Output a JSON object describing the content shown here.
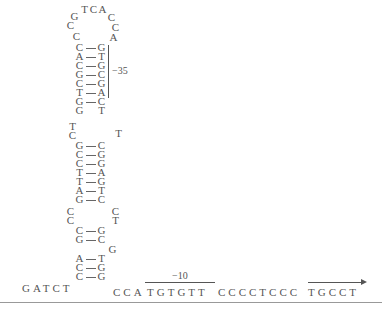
{
  "loop_top": [
    {
      "b": "T",
      "x": 80,
      "y": 4
    },
    {
      "b": "C",
      "x": 89,
      "y": 4
    },
    {
      "b": "A",
      "x": 98,
      "y": 4
    },
    {
      "b": "G",
      "x": 70,
      "y": 11
    },
    {
      "b": "C",
      "x": 107,
      "y": 12
    },
    {
      "b": "C",
      "x": 66,
      "y": 20
    },
    {
      "b": "C",
      "x": 111,
      "y": 22
    },
    {
      "b": "C",
      "x": 72,
      "y": 31
    },
    {
      "b": "A",
      "x": 109,
      "y": 32
    }
  ],
  "stem1": [
    {
      "l": "C",
      "r": "G",
      "y": 42
    },
    {
      "l": "A",
      "r": "T",
      "y": 51
    },
    {
      "l": "C",
      "r": "G",
      "y": 60
    },
    {
      "l": "G",
      "r": "C",
      "y": 69
    },
    {
      "l": "C",
      "r": "G",
      "y": 78
    },
    {
      "l": "T",
      "r": "A",
      "y": 87
    },
    {
      "l": "G",
      "r": "C",
      "y": 96
    }
  ],
  "stem1_unpaired": {
    "l": "G",
    "r": "T",
    "y": 105
  },
  "label_35": "−35",
  "bulge_mid": [
    {
      "b": "T",
      "x": 68,
      "y": 121
    },
    {
      "b": "C",
      "x": 68,
      "y": 130
    },
    {
      "b": "T",
      "x": 114,
      "y": 128
    }
  ],
  "stem2": [
    {
      "l": "G",
      "r": "C",
      "y": 140
    },
    {
      "l": "C",
      "r": "G",
      "y": 149
    },
    {
      "l": "C",
      "r": "G",
      "y": 158
    },
    {
      "l": "T",
      "r": "A",
      "y": 167
    },
    {
      "l": "T",
      "r": "G",
      "y": 176
    },
    {
      "l": "A",
      "r": "T",
      "y": 185
    },
    {
      "l": "G",
      "r": "C",
      "y": 194
    }
  ],
  "bulge_lower": [
    {
      "b": "C",
      "x": 66,
      "y": 206
    },
    {
      "b": "C",
      "x": 66,
      "y": 215
    },
    {
      "b": "C",
      "x": 111,
      "y": 206
    },
    {
      "b": "T",
      "x": 111,
      "y": 215
    }
  ],
  "stem3": [
    {
      "l": "C",
      "r": "G",
      "y": 225
    },
    {
      "l": "G",
      "r": "C",
      "y": 234
    }
  ],
  "bulge_g": {
    "b": "G",
    "x": 108,
    "y": 244
  },
  "stem4": [
    {
      "l": "A",
      "r": "T",
      "y": 253
    },
    {
      "l": "C",
      "r": "G",
      "y": 262
    },
    {
      "l": "C",
      "r": "G",
      "y": 271
    }
  ],
  "left_seq": "GATCT",
  "right_seq_prefix": "CCA",
  "box_minus10": "TGTGTT",
  "label_10": "−10",
  "middle_seq": "CCCCTCCC",
  "arrow_seq": "TGCCT"
}
